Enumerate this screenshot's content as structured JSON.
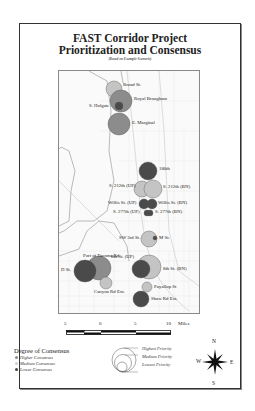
{
  "title": {
    "line1": "FAST Corridor Project",
    "line2": "Prioritization and Consensus",
    "subtitle": "(Based on Example Scenario)"
  },
  "colors": {
    "higher_consensus": "#c4c4c4",
    "medium_consensus": "#8c8c8c",
    "lower_consensus": "#4a4a4a",
    "frame": "#333333",
    "map_lines": "#d8d8d8",
    "shoreline": "#9a9a9a"
  },
  "projects": [
    {
      "name": "Broad St.",
      "consensus": "higher",
      "priority": "medium",
      "cx": 55,
      "cy": 18,
      "r": 8
    },
    {
      "name": "Royal Brougham",
      "consensus": "medium",
      "priority": "highest",
      "cx": 62,
      "cy": 30,
      "r": 11
    },
    {
      "name": "S. Holgate",
      "consensus": "lower",
      "priority": "lowest",
      "cx": 60,
      "cy": 35,
      "r": 4
    },
    {
      "name": "E. Marginal",
      "consensus": "medium",
      "priority": "highest",
      "cx": 60,
      "cy": 53,
      "r": 11
    },
    {
      "name": "180th",
      "consensus": "lower",
      "priority": "medium",
      "cx": 89,
      "cy": 100,
      "r": 9
    },
    {
      "name": "S. 212th (UP)",
      "consensus": "higher",
      "priority": "medium",
      "cx": 83,
      "cy": 118,
      "r": 8
    },
    {
      "name": "S. 212th (BN)",
      "consensus": "higher",
      "priority": "medium",
      "cx": 94,
      "cy": 118,
      "r": 9
    },
    {
      "name": "Willis St. (UP)",
      "consensus": "lower",
      "priority": "lowest",
      "cx": 85,
      "cy": 133,
      "r": 5
    },
    {
      "name": "Willis St. (BN)",
      "consensus": "lower",
      "priority": "lowest",
      "cx": 93,
      "cy": 133,
      "r": 5
    },
    {
      "name": "S. 277th (UP)",
      "consensus": "lower",
      "priority": "lowest",
      "cx": 88,
      "cy": 142,
      "r": 3
    },
    {
      "name": "S. 277th (BN)",
      "consensus": "lower",
      "priority": "lowest",
      "cx": 91,
      "cy": 142,
      "r": 3
    },
    {
      "name": "SW 3rd St.",
      "consensus": "higher",
      "priority": "medium",
      "cx": 90,
      "cy": 168,
      "r": 8
    },
    {
      "name": "M St.",
      "consensus": "lower",
      "priority": "lowest",
      "cx": 96,
      "cy": 167,
      "r": 2
    },
    {
      "name": "Port of Tacoma Rd",
      "consensus": "medium",
      "priority": "highest",
      "cx": 40,
      "cy": 197,
      "r": 12
    },
    {
      "name": "D St.",
      "consensus": "lower",
      "priority": "highest",
      "cx": 26,
      "cy": 200,
      "r": 11
    },
    {
      "name": "Canyon Rd Ext.",
      "consensus": "higher",
      "priority": "lowest",
      "cx": 47,
      "cy": 212,
      "r": 6
    },
    {
      "name": "8th St. (BN)",
      "consensus": "higher",
      "priority": "highest",
      "cx": 90,
      "cy": 196,
      "r": 12
    },
    {
      "name": "8th St. (UP)",
      "consensus": "lower",
      "priority": "medium",
      "cx": 82,
      "cy": 198,
      "r": 9
    },
    {
      "name": "Puyallup St",
      "consensus": "higher",
      "priority": "lowest",
      "cx": 88,
      "cy": 216,
      "r": 5
    },
    {
      "name": "Shaw Rd Ext.",
      "consensus": "lower",
      "priority": "medium",
      "cx": 82,
      "cy": 228,
      "r": 8
    }
  ],
  "labels": {
    "broad": "Broad St.",
    "royal": "Royal Brougham",
    "holgate": "S. Holgate",
    "marginal": "E. Marginal",
    "th180": "180th",
    "s212up": "S. 212th (UP)",
    "s212bn": "S. 212th (BN)",
    "willisup": "Willis St. (UP)",
    "willisbn": "Willis St. (BN)",
    "s277up": "S. 277th (UP)",
    "s277bn": "S. 277th (BN)",
    "sw3rd": "SW 3rd St.",
    "mst": "M St.",
    "port": "Port of Tacoma Rd",
    "dst": "D St.",
    "canyon": "Canyon Rd Ext.",
    "eighthup": "8th St. (UP)",
    "eighthbn": "8th St. (BN)",
    "puyallup": "Puyallup St",
    "shaw": "Shaw Rd Ext."
  },
  "scale_bar": {
    "ticks": [
      "5",
      "0",
      "5",
      "10"
    ],
    "unit": "Miles"
  },
  "legend": {
    "consensus_title": "Degree of Consensus",
    "consensus_items": [
      "Higher Consensus",
      "Medium Consensus",
      "Lower Consensus"
    ],
    "priority_items": [
      "Highest Priority",
      "Medium Priority",
      "Lowest Priority"
    ]
  },
  "compass": {
    "n": "N",
    "s": "S",
    "e": "E",
    "w": "W"
  }
}
